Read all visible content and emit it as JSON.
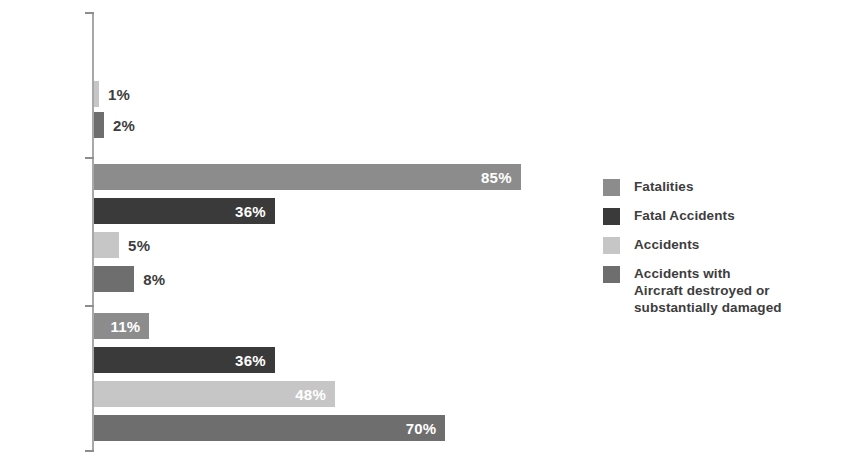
{
  "chart_data": {
    "type": "bar",
    "orientation": "horizontal",
    "title": "",
    "subtitle": "",
    "xlabel": "",
    "ylabel": "",
    "xlim": [
      0,
      100
    ],
    "grid": false,
    "legend_position": "right",
    "categories": [
      "CFIT",
      "LOC-I",
      "RS"
    ],
    "series": [
      {
        "name": "Fatalities",
        "color": "#8c8c8c",
        "values": [
          0,
          85,
          11
        ],
        "labels": [
          "",
          "85%",
          "11%"
        ]
      },
      {
        "name": "Fatal Accidents",
        "color": "#3a3a3a",
        "values": [
          0,
          36,
          36
        ],
        "labels": [
          "",
          "36%",
          "36%"
        ]
      },
      {
        "name": "Accidents",
        "color": "#c6c6c6",
        "values": [
          1,
          5,
          48
        ],
        "labels": [
          "1%",
          "5%",
          "48%"
        ]
      },
      {
        "name": "Accidents with\nAircraft destroyed or\nsubstantially damaged",
        "color": "#6e6e6e",
        "values": [
          2,
          8,
          70
        ],
        "labels": [
          "2%",
          "8%",
          "70%"
        ]
      }
    ]
  },
  "axis": {
    "category_labels": [
      {
        "text": "CFIT",
        "top": 72
      },
      {
        "text": "LOC-I",
        "top": 219
      },
      {
        "text": "RS",
        "top": 368
      }
    ],
    "ticks": [
      12,
      157,
      305,
      450
    ],
    "spine_color": "#a8a8a8",
    "tick_color": "#8d8d8d"
  },
  "bars": [
    {
      "group": "CFIT",
      "series": "Fatalities",
      "value": 0,
      "label": "",
      "color": "#8c8c8c",
      "top": 64,
      "label_inside": false
    },
    {
      "group": "CFIT",
      "series": "Fatal Accidents",
      "value": 0,
      "label": "",
      "color": "#3a3a3a",
      "top": 64,
      "label_inside": false
    },
    {
      "group": "CFIT",
      "series": "Accidents",
      "value": 1,
      "label": "1%",
      "color": "#c6c6c6",
      "top": 81,
      "label_inside": false
    },
    {
      "group": "CFIT",
      "series": "Accidents with Aircraft destroyed or substantially damaged",
      "value": 2,
      "label": "2%",
      "color": "#6e6e6e",
      "top": 112,
      "label_inside": false
    },
    {
      "group": "LOC-I",
      "series": "Fatalities",
      "value": 85,
      "label": "85%",
      "color": "#8c8c8c",
      "top": 164,
      "label_inside": true
    },
    {
      "group": "LOC-I",
      "series": "Fatal Accidents",
      "value": 36,
      "label": "36%",
      "color": "#3a3a3a",
      "top": 198,
      "label_inside": true
    },
    {
      "group": "LOC-I",
      "series": "Accidents",
      "value": 5,
      "label": "5%",
      "color": "#c6c6c6",
      "top": 232,
      "label_inside": false
    },
    {
      "group": "LOC-I",
      "series": "Accidents with Aircraft destroyed or substantially damaged",
      "value": 8,
      "label": "8%",
      "color": "#6e6e6e",
      "top": 266,
      "label_inside": false
    },
    {
      "group": "RS",
      "series": "Fatalities",
      "value": 11,
      "label": "11%",
      "color": "#8c8c8c",
      "top": 313,
      "label_inside": true
    },
    {
      "group": "RS",
      "series": "Fatal Accidents",
      "value": 36,
      "label": "36%",
      "color": "#3a3a3a",
      "top": 347,
      "label_inside": true
    },
    {
      "group": "RS",
      "series": "Accidents",
      "value": 48,
      "label": "48%",
      "color": "#c6c6c6",
      "top": 381,
      "label_inside": true
    },
    {
      "group": "RS",
      "series": "Accidents with Aircraft destroyed or substantially damaged",
      "value": 70,
      "label": "70%",
      "color": "#6e6e6e",
      "top": 415,
      "label_inside": true
    }
  ],
  "legend": {
    "items": [
      {
        "label": "Fatalities",
        "color": "#8c8c8c"
      },
      {
        "label": "Fatal Accidents",
        "color": "#3a3a3a"
      },
      {
        "label": "Accidents",
        "color": "#c6c6c6"
      },
      {
        "label": "Accidents with\nAircraft destroyed or\nsubstantially damaged",
        "color": "#6e6e6e"
      }
    ]
  },
  "scale": {
    "origin_x": 94,
    "px_per_percent": 5.02,
    "bar_height": 26
  }
}
